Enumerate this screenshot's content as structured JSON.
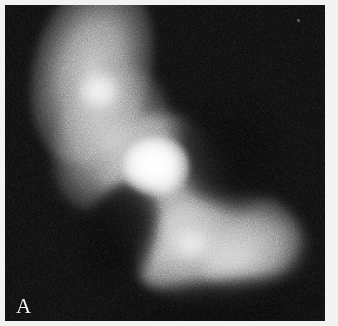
{
  "figure": {
    "panel_label": "A",
    "modality": "fluorescence micrograph",
    "colors": {
      "background": "#f2f2f0",
      "field": "#030303",
      "label_color": "#f4f4f4",
      "signal_peak": "#ffffff",
      "signal_mid": "#9a9a9a",
      "signal_low": "#3a3a3a"
    },
    "frame": {
      "border_color": "#f2f2f0",
      "border_width_px": 5,
      "field_width_px": 320,
      "field_height_px": 316
    },
    "features": [
      {
        "name": "upper-cell-arm",
        "label": "Upper diagonal cell arm",
        "center_x": 92,
        "center_y": 70,
        "intensity": "medium"
      },
      {
        "name": "upper-bright-focus",
        "label": "Secondary bright focus",
        "center_x": 94,
        "center_y": 86,
        "intensity": "high"
      },
      {
        "name": "central-bright-core",
        "label": "Bright nuclear region",
        "center_x": 151,
        "center_y": 161,
        "intensity": "saturated"
      },
      {
        "name": "lower-right-lobe",
        "label": "Lower right cell lobe",
        "center_x": 212,
        "center_y": 242,
        "intensity": "medium"
      },
      {
        "name": "lower-bright-focus",
        "label": "Faint lower focus",
        "center_x": 186,
        "center_y": 239,
        "intensity": "low"
      },
      {
        "name": "dust-speck",
        "label": "Imaging artifact speck",
        "center_x": 293,
        "center_y": 15,
        "intensity": "trace"
      }
    ]
  }
}
